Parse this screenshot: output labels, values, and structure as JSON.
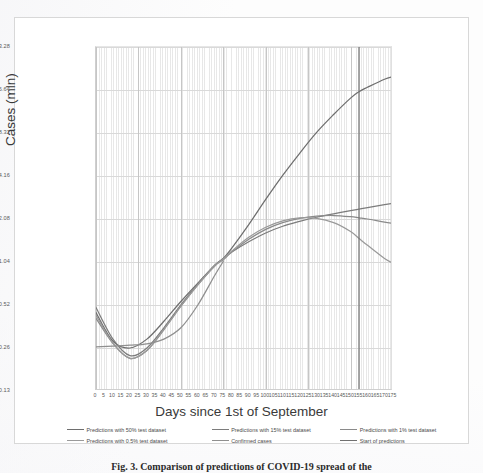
{
  "figure": {
    "caption": "Fig. 3. Comparison of predictions of COVID-19 spread of the",
    "y_axis_title": "Cases (mln)",
    "x_axis_title": "Days since 1st of September"
  },
  "chart_data": {
    "type": "line",
    "title": "",
    "xlabel": "Days since 1st of September",
    "ylabel": "Cases (mln)",
    "yscale": "log2",
    "ylim": [
      0.13,
      33.28
    ],
    "xlim": [
      0,
      175
    ],
    "grid": true,
    "legend_position": "bottom",
    "ytick_labels": [
      "33.28",
      "16.64",
      "8.32",
      "4.16",
      "2.08",
      "1.04",
      "0.52",
      "0.26",
      "0.13"
    ],
    "ytick_values": [
      33.28,
      16.64,
      8.32,
      4.16,
      2.08,
      1.04,
      0.52,
      0.26,
      0.13
    ],
    "xtick_labels": [
      "0",
      "5",
      "10",
      "15",
      "20",
      "25",
      "30",
      "35",
      "40",
      "45",
      "50",
      "55",
      "60",
      "65",
      "70",
      "75",
      "80",
      "85",
      "90",
      "95",
      "100",
      "105",
      "110",
      "115",
      "120",
      "125",
      "130",
      "135",
      "140",
      "145",
      "150",
      "155",
      "160",
      "165",
      "170",
      "175"
    ],
    "xtick_values": [
      0,
      5,
      10,
      15,
      20,
      25,
      30,
      35,
      40,
      45,
      50,
      55,
      60,
      65,
      70,
      75,
      80,
      85,
      90,
      95,
      100,
      105,
      110,
      115,
      120,
      125,
      130,
      135,
      140,
      145,
      150,
      155,
      160,
      165,
      170,
      175
    ],
    "annotations": [
      {
        "name": "start-of-predictions",
        "type": "vline",
        "x": 155,
        "label": "Start of predictions"
      }
    ],
    "series": [
      {
        "name": "Predictions with 50% test dataset",
        "color": "#6e6e6e",
        "x": [
          0,
          10,
          20,
          30,
          40,
          50,
          60,
          70,
          75,
          80,
          90,
          100,
          110,
          120,
          130,
          140,
          150,
          155,
          160,
          170,
          175
        ],
        "y": [
          0.46,
          0.29,
          0.26,
          0.3,
          0.4,
          0.55,
          0.74,
          0.98,
          1.1,
          1.3,
          1.9,
          2.85,
          4.2,
          6.0,
          8.4,
          11.2,
          14.6,
          16.2,
          17.4,
          19.8,
          20.6
        ]
      },
      {
        "name": "Predictions with 15% test dataset",
        "color": "#7c7c7c",
        "x": [
          0,
          10,
          20,
          30,
          40,
          50,
          60,
          70,
          75,
          80,
          90,
          100,
          110,
          120,
          130,
          140,
          150,
          155,
          160,
          170,
          175
        ],
        "y": [
          0.5,
          0.3,
          0.23,
          0.26,
          0.36,
          0.52,
          0.73,
          0.99,
          1.1,
          1.22,
          1.44,
          1.66,
          1.85,
          2.0,
          2.14,
          2.26,
          2.38,
          2.44,
          2.5,
          2.62,
          2.68
        ]
      },
      {
        "name": "Predictions with 1% test dataset",
        "color": "#8a8a8a",
        "x": [
          0,
          10,
          20,
          30,
          40,
          50,
          60,
          70,
          75,
          80,
          90,
          100,
          110,
          120,
          130,
          140,
          150,
          155,
          160,
          170,
          175
        ],
        "y": [
          0.42,
          0.28,
          0.22,
          0.25,
          0.35,
          0.51,
          0.72,
          0.98,
          1.08,
          1.22,
          1.5,
          1.76,
          1.96,
          2.1,
          2.18,
          2.2,
          2.16,
          2.12,
          2.08,
          1.98,
          1.94
        ]
      },
      {
        "name": "Predictions with 0.5% test dataset",
        "color": "#9a9a9a",
        "x": [
          0,
          10,
          20,
          30,
          40,
          50,
          60,
          70,
          75,
          80,
          90,
          100,
          110,
          120,
          130,
          140,
          150,
          155,
          160,
          170,
          175
        ],
        "y": [
          0.44,
          0.28,
          0.22,
          0.25,
          0.35,
          0.51,
          0.72,
          0.98,
          1.09,
          1.24,
          1.55,
          1.82,
          2.02,
          2.12,
          2.1,
          1.96,
          1.7,
          1.52,
          1.36,
          1.1,
          1.02
        ]
      },
      {
        "name": "Confirmed cases",
        "color": "#8f8f8f",
        "x": [
          0,
          10,
          20,
          30,
          40,
          50,
          60,
          70,
          75
        ],
        "y": [
          0.265,
          0.268,
          0.272,
          0.278,
          0.3,
          0.36,
          0.52,
          0.84,
          1.05
        ]
      }
    ]
  },
  "y_ticks": [
    {
      "label": "33.28",
      "top": 0
    },
    {
      "label": "16.64",
      "top": 43
    },
    {
      "label": "8.32",
      "top": 86
    },
    {
      "label": "4.16",
      "top": 129
    },
    {
      "label": "2.08",
      "top": 172
    },
    {
      "label": "1.04",
      "top": 215
    },
    {
      "label": "0.52",
      "top": 258
    },
    {
      "label": "0.26",
      "top": 301
    },
    {
      "label": "0.13",
      "top": 344
    }
  ],
  "legend": {
    "row1": [
      {
        "label": "Predictions with 50% test dataset",
        "color": "#6e6e6e"
      },
      {
        "label": "Predictions with 15% test dataset",
        "color": "#7c7c7c"
      },
      {
        "label": "Predictions with 1% test dataset",
        "color": "#8a8a8a"
      }
    ],
    "row2": [
      {
        "label": "Predictions with 0.5% test dataset",
        "color": "#9a9a9a"
      },
      {
        "label": "Confirmed cases",
        "color": "#8f8f8f"
      },
      {
        "label": "Start of predictions",
        "color": "#707070"
      }
    ]
  }
}
